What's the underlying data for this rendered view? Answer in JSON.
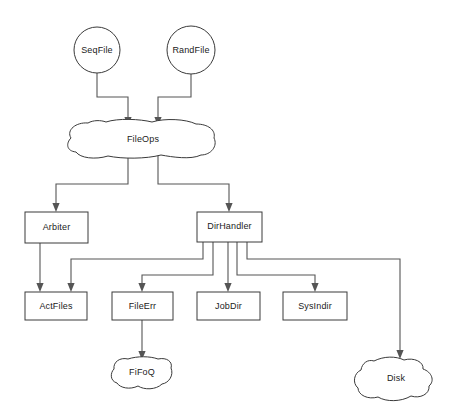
{
  "diagram": {
    "background_color": "#ffffff",
    "stroke_color": "#3a3a3a",
    "edge_color": "#555555",
    "text_color": "#1b1b1b",
    "nodes": [
      {
        "id": "seqfile",
        "label": "SeqFile",
        "shape": "circle",
        "cx": 97,
        "cy": 50,
        "r": 23
      },
      {
        "id": "randfile",
        "label": "RandFile",
        "shape": "circle",
        "cx": 191,
        "cy": 50,
        "r": 24
      },
      {
        "id": "fileops",
        "label": "FileOps",
        "shape": "blob",
        "cx": 143,
        "cy": 140,
        "w": 146,
        "h": 40
      },
      {
        "id": "arbiter",
        "label": "Arbiter",
        "shape": "rect",
        "x": 25,
        "y": 212,
        "w": 63,
        "h": 31
      },
      {
        "id": "dirhandler",
        "label": "DirHandler",
        "shape": "rect",
        "x": 197,
        "y": 212,
        "w": 65,
        "h": 30
      },
      {
        "id": "actfiles",
        "label": "ActFiles",
        "shape": "rect",
        "x": 25,
        "y": 292,
        "w": 62,
        "h": 28
      },
      {
        "id": "fileerr",
        "label": "FileErr",
        "shape": "rect",
        "x": 112,
        "y": 292,
        "w": 61,
        "h": 28
      },
      {
        "id": "jobdir",
        "label": "JobDir",
        "shape": "rect",
        "x": 197,
        "y": 292,
        "w": 63,
        "h": 28
      },
      {
        "id": "sysindir",
        "label": "SysIndir",
        "shape": "rect",
        "x": 283,
        "y": 292,
        "w": 64,
        "h": 28
      },
      {
        "id": "fifoq",
        "label": "FiFoQ",
        "shape": "blob",
        "cx": 142,
        "cy": 374,
        "w": 60,
        "h": 32
      },
      {
        "id": "disk",
        "label": "Disk",
        "shape": "blob",
        "cx": 396,
        "cy": 380,
        "w": 78,
        "h": 44
      }
    ],
    "edges": [
      {
        "id": "seqfile-to-fileops",
        "from": "SeqFile",
        "to": "FileOps"
      },
      {
        "id": "randfile-to-fileops",
        "from": "RandFile",
        "to": "FileOps"
      },
      {
        "id": "fileops-to-arbiter",
        "from": "FileOps",
        "to": "Arbiter"
      },
      {
        "id": "fileops-to-dirhandler",
        "from": "FileOps",
        "to": "DirHandler"
      },
      {
        "id": "arbiter-to-actfiles",
        "from": "Arbiter",
        "to": "ActFiles"
      },
      {
        "id": "dirhandler-to-actfiles",
        "from": "DirHandler",
        "to": "ActFiles"
      },
      {
        "id": "dirhandler-to-fileerr",
        "from": "DirHandler",
        "to": "FileErr"
      },
      {
        "id": "dirhandler-to-jobdir",
        "from": "DirHandler",
        "to": "JobDir"
      },
      {
        "id": "dirhandler-to-sysindir",
        "from": "DirHandler",
        "to": "SysIndir"
      },
      {
        "id": "dirhandler-to-disk",
        "from": "DirHandler",
        "to": "Disk"
      },
      {
        "id": "fileerr-to-fifoq",
        "from": "FileErr",
        "to": "FiFoQ"
      }
    ]
  }
}
